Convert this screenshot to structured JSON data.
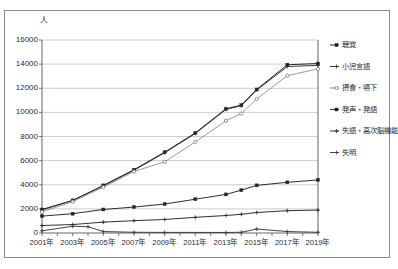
{
  "chart_data": {
    "type": "line",
    "title": "",
    "xlabel": "",
    "ylabel": "人",
    "unit_label": "人",
    "ylim": [
      0,
      16000
    ],
    "grid": true,
    "legend_position": "right",
    "ytick_labels": [
      "16000",
      "14000",
      "12000",
      "10000",
      "8000",
      "6000",
      "4000",
      "2000",
      "0"
    ],
    "ytick_values": [
      16000,
      14000,
      12000,
      10000,
      8000,
      6000,
      4000,
      2000,
      0
    ],
    "x": [
      2001,
      2002,
      2003,
      2004,
      2005,
      2006,
      2007,
      2008,
      2009,
      2010,
      2011,
      2012,
      2013,
      2014,
      2015,
      2016,
      2017,
      2018,
      2019
    ],
    "categories": [
      "2001年",
      "2002年",
      "2003年",
      "2004年",
      "2005年",
      "2006年",
      "2007年",
      "2008年",
      "2009年",
      "2010年",
      "2011年",
      "2012年",
      "2013年",
      "2014年",
      "2015年",
      "2016年",
      "2017年",
      "2018年",
      "2019年"
    ],
    "xtick_labels": [
      "2001年",
      "2003年",
      "2005年",
      "2007年",
      "2009年",
      "2011年",
      "2013年",
      "2015年",
      "2017年",
      "2019年"
    ],
    "xtick_values": [
      2001,
      2003,
      2005,
      2007,
      2009,
      2011,
      2013,
      2015,
      2017,
      2019
    ],
    "series": [
      {
        "name": "聴覚",
        "color": "#1a1a1a",
        "marker": "square",
        "values": [
          1950,
          2700,
          3950,
          5250,
          6700,
          8300,
          10300,
          10600,
          11900,
          13950,
          14050
        ],
        "x": [
          2001,
          2003,
          2005,
          2007,
          2009,
          2011,
          2013,
          2014,
          2015,
          2017,
          2019
        ]
      },
      {
        "name": "小児言語",
        "color": "#2e2e2e",
        "marker": "cross",
        "values": [
          1900,
          2700,
          3900,
          5200,
          6650,
          8250,
          10250,
          10550,
          11850,
          13800,
          13900
        ],
        "x": [
          2001,
          2003,
          2005,
          2007,
          2009,
          2011,
          2013,
          2014,
          2015,
          2017,
          2019
        ]
      },
      {
        "name": "摂食・嚥下",
        "color": "#7a7a7a",
        "marker": "circle",
        "values": [
          1750,
          2600,
          3800,
          5100,
          5900,
          7550,
          9300,
          9900,
          11100,
          13050,
          13600
        ],
        "x": [
          2001,
          2003,
          2005,
          2007,
          2009,
          2011,
          2013,
          2014,
          2015,
          2017,
          2019
        ]
      },
      {
        "name": "発声・発語",
        "color": "#222222",
        "marker": "square",
        "values": [
          1400,
          1600,
          1950,
          2150,
          2400,
          2800,
          3200,
          3550,
          3950,
          4200,
          4400
        ],
        "x": [
          2001,
          2003,
          2005,
          2007,
          2009,
          2011,
          2013,
          2014,
          2015,
          2017,
          2019
        ]
      },
      {
        "name": "失語・高次脳機能",
        "color": "#262626",
        "marker": "cross",
        "values": [
          620,
          700,
          900,
          1020,
          1120,
          1300,
          1450,
          1550,
          1700,
          1850,
          1900
        ],
        "x": [
          2001,
          2003,
          2005,
          2007,
          2009,
          2011,
          2013,
          2014,
          2015,
          2017,
          2019
        ]
      },
      {
        "name": "失明",
        "color": "#3a3a3a",
        "marker": "cross",
        "values": [
          180,
          560,
          520,
          120,
          60,
          50,
          45,
          60,
          330,
          120,
          60
        ],
        "x": [
          2001,
          2003,
          2004,
          2005,
          2007,
          2009,
          2013,
          2014,
          2015,
          2017,
          2019
        ]
      }
    ],
    "axis_color": "#555555",
    "grid_color": "#b9b9b9",
    "frame_color": "#8a8a8a",
    "background": "#ffffff"
  }
}
